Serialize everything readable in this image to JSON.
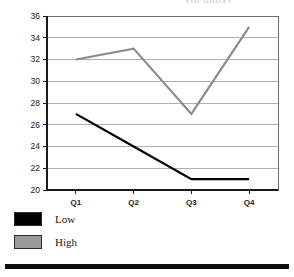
{
  "title_sliver": "(in units)",
  "chart_data": {
    "type": "line",
    "title": "",
    "xlabel": "",
    "ylabel": "",
    "categories": [
      "Q1",
      "Q2",
      "Q3",
      "Q4"
    ],
    "ylim": [
      20,
      36
    ],
    "yticks": [
      20,
      22,
      24,
      26,
      28,
      30,
      32,
      34,
      36
    ],
    "grid": true,
    "legend_position": "below-left",
    "series": [
      {
        "name": "Low",
        "color": "#000000",
        "values": [
          27,
          24,
          21,
          21
        ]
      },
      {
        "name": "High",
        "color": "#8c8c8c",
        "values": [
          32,
          33,
          27,
          35
        ]
      }
    ]
  },
  "legend": {
    "items": [
      {
        "label": "Low",
        "color": "#000000"
      },
      {
        "label": "High",
        "color": "#999999"
      }
    ]
  },
  "colors": {
    "axis": "#1a1a1a",
    "gridline": "#b0b0b0",
    "low_series": "#000000",
    "high_series": "#8c8c8c",
    "rule": "#0d0d0d"
  }
}
